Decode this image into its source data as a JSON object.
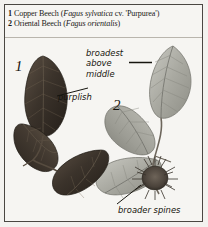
{
  "plate": {
    "background_color": "#f6f5f2",
    "border_color": "#4a4742"
  },
  "caption": {
    "entries": [
      {
        "number": "1",
        "common_name": "Copper Beech",
        "scientific_name": "Fagus sylvatica",
        "qualifier": "cv. 'Purpurea'",
        "full_text": "1 Copper Beech (Fagus sylvatica cv. 'Purpurea')"
      },
      {
        "number": "2",
        "common_name": "Oriental Beech",
        "scientific_name": "Fagus orientalis",
        "qualifier": "",
        "full_text": "2 Oriental Beech (Fagus orientalis)"
      }
    ]
  },
  "figure_labels": {
    "label_1": "1",
    "label_2": "2"
  },
  "annotations": [
    {
      "id": "broadest-above-middle",
      "text_line_1": "broadest",
      "text_line_2": "above",
      "text_line_3": "middle",
      "full_text": "broadest above middle",
      "points_to": "oriental-beech-leaf"
    },
    {
      "id": "purplish",
      "full_text": "purplish",
      "points_to": "copper-beech-leaf"
    },
    {
      "id": "broader-spines",
      "full_text": "broader spines",
      "points_to": "beech-nut-husk"
    }
  ],
  "illustration": {
    "specimen_1_color": "#3a3129",
    "specimen_2_color": "#a6a79f",
    "items": [
      {
        "name": "copper-beech-leaf-upper",
        "species": "1"
      },
      {
        "name": "copper-beech-leaf-lower-left",
        "species": "1"
      },
      {
        "name": "copper-beech-leaf-lower-right",
        "species": "1"
      },
      {
        "name": "oriental-beech-leaf-upper-right",
        "species": "2"
      },
      {
        "name": "oriental-beech-leaf-middle",
        "species": "2"
      },
      {
        "name": "oriental-beech-leaf-lower",
        "species": "2"
      },
      {
        "name": "beech-nut-husk",
        "species": "2"
      }
    ]
  }
}
